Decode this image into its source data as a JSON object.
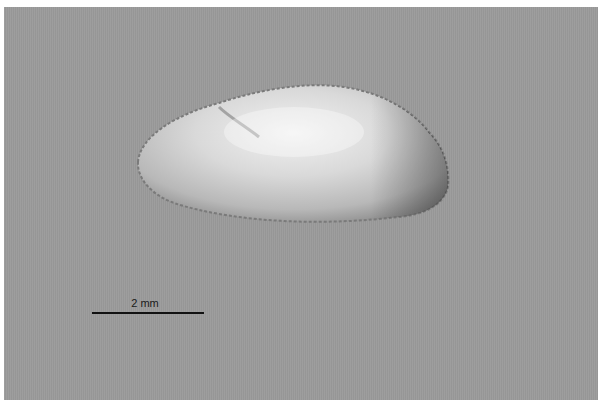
{
  "image": {
    "subject": "translucent ostracod-like shell specimen on gray background",
    "background_color": "#9b9b9b",
    "scale_bar": {
      "label": "2 mm"
    }
  }
}
